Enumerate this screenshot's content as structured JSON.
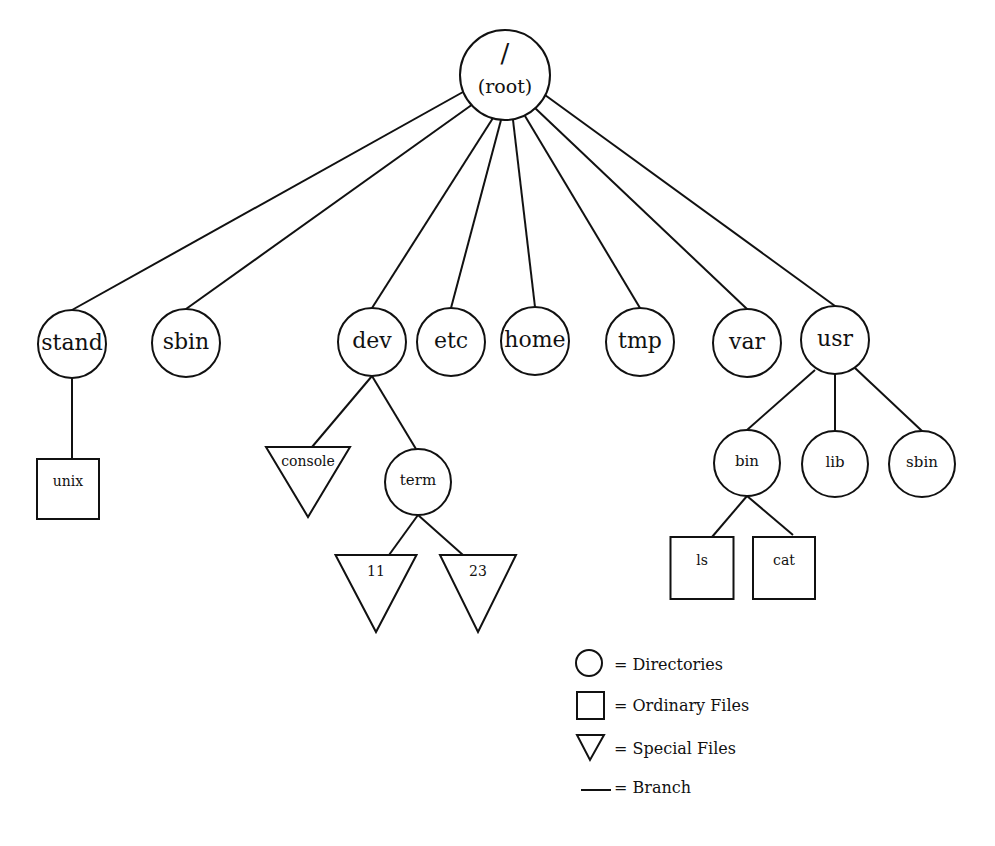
{
  "diagram": {
    "root": {
      "id": "root",
      "slash": "/",
      "label": "(root)",
      "x": 505,
      "y": 75,
      "r": 45
    },
    "nodes": [
      {
        "id": "stand",
        "label": "stand",
        "type": "dir",
        "x": 72,
        "y": 344,
        "r": 34,
        "fs": 22
      },
      {
        "id": "sbin",
        "label": "sbin",
        "type": "dir",
        "x": 186,
        "y": 343,
        "r": 34,
        "fs": 22
      },
      {
        "id": "dev",
        "label": "dev",
        "type": "dir",
        "x": 372,
        "y": 342,
        "r": 34,
        "fs": 22
      },
      {
        "id": "etc",
        "label": "etc",
        "type": "dir",
        "x": 451,
        "y": 342,
        "r": 34,
        "fs": 22
      },
      {
        "id": "home",
        "label": "home",
        "type": "dir",
        "x": 535,
        "y": 341,
        "r": 34,
        "fs": 22
      },
      {
        "id": "tmp",
        "label": "tmp",
        "type": "dir",
        "x": 640,
        "y": 342,
        "r": 34,
        "fs": 22
      },
      {
        "id": "var",
        "label": "var",
        "type": "dir",
        "x": 747,
        "y": 343,
        "r": 34,
        "fs": 22
      },
      {
        "id": "usr",
        "label": "usr",
        "type": "dir",
        "x": 835,
        "y": 340,
        "r": 34,
        "fs": 22
      },
      {
        "id": "unix",
        "label": "unix",
        "type": "file",
        "x": 68,
        "y": 489,
        "w": 62,
        "h": 60,
        "fs": 14
      },
      {
        "id": "console",
        "label": "console",
        "type": "special",
        "x": 308,
        "y": 447,
        "w": 84,
        "h": 70,
        "fs": 14,
        "ty": 466
      },
      {
        "id": "term",
        "label": "term",
        "type": "dir",
        "x": 418,
        "y": 482,
        "r": 33,
        "fs": 15
      },
      {
        "id": "t11",
        "label": "11",
        "type": "special",
        "x": 376,
        "y": 555,
        "w": 81,
        "h": 77,
        "fs": 14,
        "ty": 576
      },
      {
        "id": "t23",
        "label": "23",
        "type": "special",
        "x": 478,
        "y": 555,
        "w": 76,
        "h": 77,
        "fs": 14,
        "ty": 576
      },
      {
        "id": "bin",
        "label": "bin",
        "type": "dir",
        "x": 747,
        "y": 463,
        "r": 33,
        "fs": 15
      },
      {
        "id": "lib",
        "label": "lib",
        "type": "dir",
        "x": 835,
        "y": 464,
        "r": 33,
        "fs": 15
      },
      {
        "id": "usbin",
        "label": "sbin",
        "type": "dir",
        "x": 922,
        "y": 464,
        "r": 33,
        "fs": 15
      },
      {
        "id": "ls",
        "label": "ls",
        "type": "file",
        "x": 702,
        "y": 568,
        "w": 63,
        "h": 62,
        "fs": 14
      },
      {
        "id": "cat",
        "label": "cat",
        "type": "file",
        "x": 784,
        "y": 568,
        "w": 62,
        "h": 62,
        "fs": 14
      }
    ],
    "edges": [
      [
        463,
        92,
        72,
        310
      ],
      [
        473,
        104,
        186,
        309
      ],
      [
        493,
        118,
        372,
        308
      ],
      [
        501,
        120,
        451,
        308
      ],
      [
        513,
        120,
        535,
        307
      ],
      [
        525,
        116,
        640,
        308
      ],
      [
        535,
        108,
        747,
        309
      ],
      [
        545,
        95,
        835,
        306
      ],
      [
        72,
        378,
        72,
        459
      ],
      [
        372,
        376,
        312,
        447
      ],
      [
        372,
        376,
        416,
        449
      ],
      [
        418,
        515,
        389,
        555
      ],
      [
        418,
        515,
        463,
        555
      ],
      [
        815,
        370,
        747,
        430
      ],
      [
        835,
        374,
        835,
        431
      ],
      [
        855,
        368,
        922,
        431
      ],
      [
        747,
        496,
        712,
        537
      ],
      [
        747,
        496,
        793,
        535
      ]
    ],
    "legend": {
      "items": [
        {
          "symbol": "circle",
          "label": "= Directories"
        },
        {
          "symbol": "square",
          "label": "= Ordinary Files"
        },
        {
          "symbol": "triangle",
          "label": "= Special Files"
        },
        {
          "symbol": "line",
          "label": "= Branch"
        }
      ]
    }
  }
}
